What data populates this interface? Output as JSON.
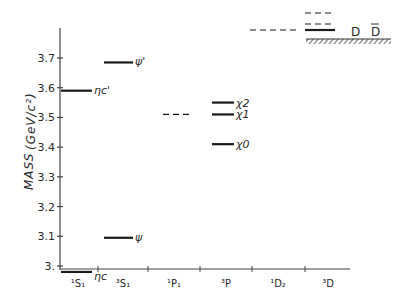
{
  "chart_data": {
    "type": "diagram",
    "title": "",
    "ylabel": "MASS (GeV/c²)",
    "ylim": [
      2.97,
      3.82
    ],
    "yticks": [
      {
        "value": 3.0,
        "label": "3."
      },
      {
        "value": 3.1,
        "label": "3.1"
      },
      {
        "value": 3.2,
        "label": "3.2"
      },
      {
        "value": 3.3,
        "label": "3.3"
      },
      {
        "value": 3.4,
        "label": "3.4"
      },
      {
        "value": 3.5,
        "label": "3.5"
      },
      {
        "value": 3.6,
        "label": "3.6"
      },
      {
        "value": 3.7,
        "label": "3.7"
      }
    ],
    "categories": [
      {
        "id": "1S1",
        "label": "¹S₁"
      },
      {
        "id": "3S1",
        "label": "³S₁"
      },
      {
        "id": "1P1",
        "label": "¹P₁"
      },
      {
        "id": "3P",
        "label": "³P"
      },
      {
        "id": "1D2",
        "label": "¹D₂"
      },
      {
        "id": "3D",
        "label": "³D"
      }
    ],
    "levels": [
      {
        "category": "1S1",
        "mass": 2.98,
        "label": "ηc",
        "style": "solid"
      },
      {
        "category": "1S1",
        "mass": 3.59,
        "label": "ηc'",
        "style": "solid"
      },
      {
        "category": "3S1",
        "mass": 3.095,
        "label": "ψ",
        "style": "solid"
      },
      {
        "category": "3S1",
        "mass": 3.685,
        "label": "ψ'",
        "style": "solid"
      },
      {
        "category": "1P1",
        "mass": 3.51,
        "label": "",
        "style": "dashed"
      },
      {
        "category": "3P",
        "mass": 3.55,
        "label": "χ2",
        "style": "solid"
      },
      {
        "category": "3P",
        "mass": 3.51,
        "label": "χ1",
        "style": "solid"
      },
      {
        "category": "3P",
        "mass": 3.41,
        "label": "χ0",
        "style": "solid"
      },
      {
        "category": "1D2",
        "mass": 3.77,
        "label": "",
        "style": "dashed"
      },
      {
        "category": "3D",
        "mass": 3.77,
        "label": "",
        "style": "solid"
      },
      {
        "category": "3D",
        "mass": 3.79,
        "label": "",
        "style": "dashed"
      },
      {
        "category": "3D",
        "mass": 3.82,
        "label": "",
        "style": "dashed"
      }
    ],
    "threshold": {
      "label": "D D̄",
      "mass": 3.73,
      "note": "hatched DD̄ threshold line"
    },
    "grid": false,
    "legend": null
  },
  "axis": {
    "ylabel": "MASS",
    "yunit": "(GeV/c²)"
  },
  "threshold_labels": {
    "d": "D",
    "dbar": "D"
  }
}
